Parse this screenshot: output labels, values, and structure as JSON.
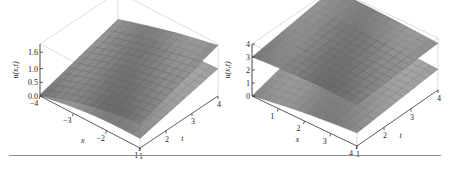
{
  "chart_data": [
    {
      "type": "surface3d",
      "title": "",
      "xlabel": "x",
      "ylabel": "t",
      "zlabel": "u(x,t)",
      "xlim": [
        -4,
        -1
      ],
      "ylim": [
        1,
        4
      ],
      "zlim": [
        0,
        1.9
      ],
      "xticks": [
        "-4",
        "-3",
        "-2",
        "-1"
      ],
      "yticks": [
        "1",
        "2",
        "3",
        "4"
      ],
      "zticks": [
        "0.0",
        "0.5",
        "1.0",
        "1.6"
      ],
      "surface_color": "#8c8c8c",
      "series": [
        {
          "name": "upper surface",
          "description": "rises with t; curved in x",
          "z_at_corners": {
            "x_min_t_min": 0.05,
            "x_max_t_min": 0.9,
            "x_min_t_max": 0.9,
            "x_max_t_max": 1.85
          }
        },
        {
          "name": "lower surface",
          "description": "flatter sheet",
          "z_at_corners": {
            "x_min_t_min": 0.0,
            "x_max_t_min": 0.35,
            "x_min_t_max": 0.6,
            "x_max_t_max": 1.0
          }
        }
      ]
    },
    {
      "type": "surface3d",
      "title": "",
      "xlabel": "x",
      "ylabel": "t",
      "zlabel": "u(x,t)",
      "xlim": [
        0,
        4
      ],
      "ylim": [
        1,
        4
      ],
      "zlim": [
        0,
        4
      ],
      "xticks": [
        "1",
        "2",
        "3",
        "4"
      ],
      "yticks": [
        "1",
        "2",
        "3",
        "4"
      ],
      "zticks": [
        "0",
        "1",
        "2",
        "3",
        "4"
      ],
      "surface_color": "#8c8c8c",
      "series": [
        {
          "name": "upper surface",
          "description": "near-flat sheet around u≈3–4",
          "z_at_corners": {
            "x_min_t_min": 3.0,
            "x_max_t_min": 3.2,
            "x_min_t_max": 3.9,
            "x_max_t_max": 3.6
          }
        },
        {
          "name": "lower surface",
          "description": "rises from u≈0 at x=0 to ≈1–2",
          "z_at_corners": {
            "x_min_t_min": 0.0,
            "x_max_t_min": 1.0,
            "x_min_t_max": 1.8,
            "x_max_t_max": 1.6
          }
        }
      ]
    }
  ]
}
